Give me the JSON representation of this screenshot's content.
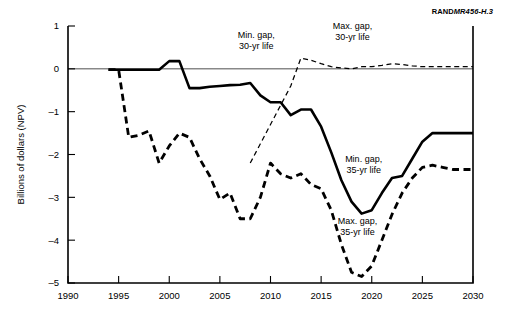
{
  "figure": {
    "credit_rand": "RAND",
    "credit_doc": "MR456-H.3"
  },
  "chart_data": {
    "type": "line",
    "title": "",
    "xlabel": "",
    "ylabel": "Billions of dollars (NPV)",
    "xlim": [
      1990,
      2030
    ],
    "ylim": [
      -5,
      1
    ],
    "xticks": [
      1990,
      1995,
      2000,
      2005,
      2010,
      2015,
      2020,
      2025,
      2030
    ],
    "xticklabels": [
      "1990",
      "1995",
      "2000",
      "2005",
      "2010",
      "2015",
      "2020",
      "2025",
      "2030"
    ],
    "yticks": [
      1,
      0,
      -1,
      -2,
      -3,
      -4,
      -5
    ],
    "yticklabels": [
      "1",
      "0",
      "-1",
      "-2",
      "-3",
      "-4",
      "-5"
    ],
    "grid": false,
    "legend": "inline-annotations",
    "zero_reference_line": 0,
    "series": [
      {
        "name": "Min. gap, 30-yr life",
        "style": "solid-thick",
        "x": [
          1994,
          1995,
          1996,
          1997,
          1998,
          1999,
          2000,
          2001,
          2002,
          2003,
          2004,
          2005,
          2006,
          2007,
          2008,
          2009,
          2010,
          2011,
          2012,
          2013,
          2014,
          2015,
          2016,
          2017,
          2018,
          2019,
          2020,
          2021,
          2022,
          2023,
          2024,
          2025,
          2026,
          2027,
          2028,
          2029,
          2030
        ],
        "values": [
          -0.02,
          -0.02,
          -0.02,
          -0.02,
          -0.02,
          -0.02,
          0.18,
          0.18,
          -0.45,
          -0.45,
          -0.42,
          -0.4,
          -0.38,
          -0.37,
          -0.33,
          -0.62,
          -0.78,
          -0.78,
          -1.08,
          -0.95,
          -0.95,
          -1.35,
          -1.95,
          -2.6,
          -3.1,
          -3.38,
          -3.3,
          -2.9,
          -2.55,
          -2.5,
          -2.1,
          -1.7,
          -1.5,
          -1.5,
          -1.5,
          -1.5,
          -1.5
        ]
      },
      {
        "name": "Max. gap, 35-yr life",
        "style": "dash-thick",
        "x": [
          1994,
          1995,
          1996,
          1997,
          1998,
          1999,
          2000,
          2001,
          2002,
          2003,
          2004,
          2005,
          2006,
          2007,
          2008,
          2009,
          2010,
          2011,
          2012,
          2013,
          2014,
          2015,
          2016,
          2017,
          2018,
          2019,
          2020,
          2021,
          2022,
          2023,
          2024,
          2025,
          2026,
          2027,
          2028,
          2029,
          2030
        ],
        "values": [
          -0.02,
          -0.02,
          -1.6,
          -1.55,
          -1.45,
          -2.2,
          -1.8,
          -1.5,
          -1.6,
          -2.1,
          -2.5,
          -3.05,
          -2.9,
          -3.5,
          -3.5,
          -3.0,
          -2.2,
          -2.45,
          -2.55,
          -2.45,
          -2.7,
          -2.8,
          -3.3,
          -4.1,
          -4.75,
          -4.85,
          -4.6,
          -4.0,
          -3.4,
          -2.9,
          -2.55,
          -2.3,
          -2.25,
          -2.3,
          -2.35,
          -2.35,
          -2.35
        ]
      },
      {
        "name": "Max. gap, 30-yr life",
        "style": "dash-thin",
        "x": [
          2008,
          2009,
          2010,
          2011,
          2012,
          2013,
          2014,
          2015,
          2016,
          2017,
          2018,
          2019,
          2020,
          2021,
          2022,
          2023,
          2024,
          2025,
          2026,
          2027,
          2028,
          2029,
          2030
        ],
        "values": [
          -2.2,
          -1.75,
          -1.3,
          -0.85,
          -0.4,
          0.25,
          0.2,
          0.12,
          0.05,
          0.02,
          0.0,
          0.05,
          0.05,
          0.08,
          0.12,
          0.1,
          0.07,
          0.05,
          0.05,
          0.05,
          0.05,
          0.05,
          0.05
        ]
      },
      {
        "name": "Min. gap, 35-yr life",
        "style": "annotation-only",
        "x": [],
        "values": []
      }
    ],
    "annotations": [
      {
        "text_line1": "Min. gap,",
        "text_line2": "30-yr life",
        "x": 2008.6,
        "y": 0.72
      },
      {
        "text_line1": "Max. gap,",
        "text_line2": "30-yr life",
        "x": 2018.1,
        "y": 0.93
      },
      {
        "text_line1": "Min. gap,",
        "text_line2": "35-yr life",
        "x": 2019.2,
        "y": -2.17
      },
      {
        "text_line1": "Max. gap,",
        "text_line2": "35-yr life",
        "x": 2018.6,
        "y": -3.62
      }
    ]
  }
}
